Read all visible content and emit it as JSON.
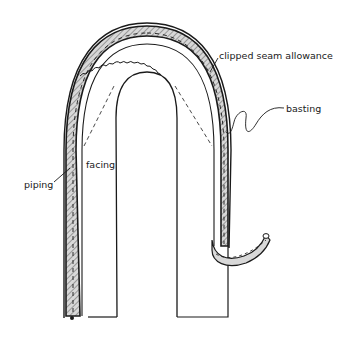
{
  "diagram": {
    "colors": {
      "ink": "#1a1a1a",
      "piping_fill": "#d8d8d8",
      "background": "#ffffff"
    },
    "labels": {
      "clipped_seam_allowance": "clipped seam allowance",
      "basting": "basting",
      "facing": "facing",
      "piping": "piping"
    }
  }
}
